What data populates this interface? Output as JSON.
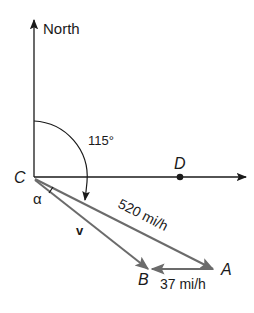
{
  "diagram": {
    "axes": {
      "north_label": "North",
      "east_axis": true
    },
    "angle_label": "115°",
    "points": {
      "C": "C",
      "D": "D",
      "A": "A",
      "B": "B"
    },
    "alpha_label": "α",
    "vectors": {
      "v_label": "v",
      "ca_label": "520 mi/h",
      "ab_label": "37 mi/h"
    },
    "colors": {
      "axis": "#1a1a1a",
      "vector": "#6b6b6b"
    }
  }
}
